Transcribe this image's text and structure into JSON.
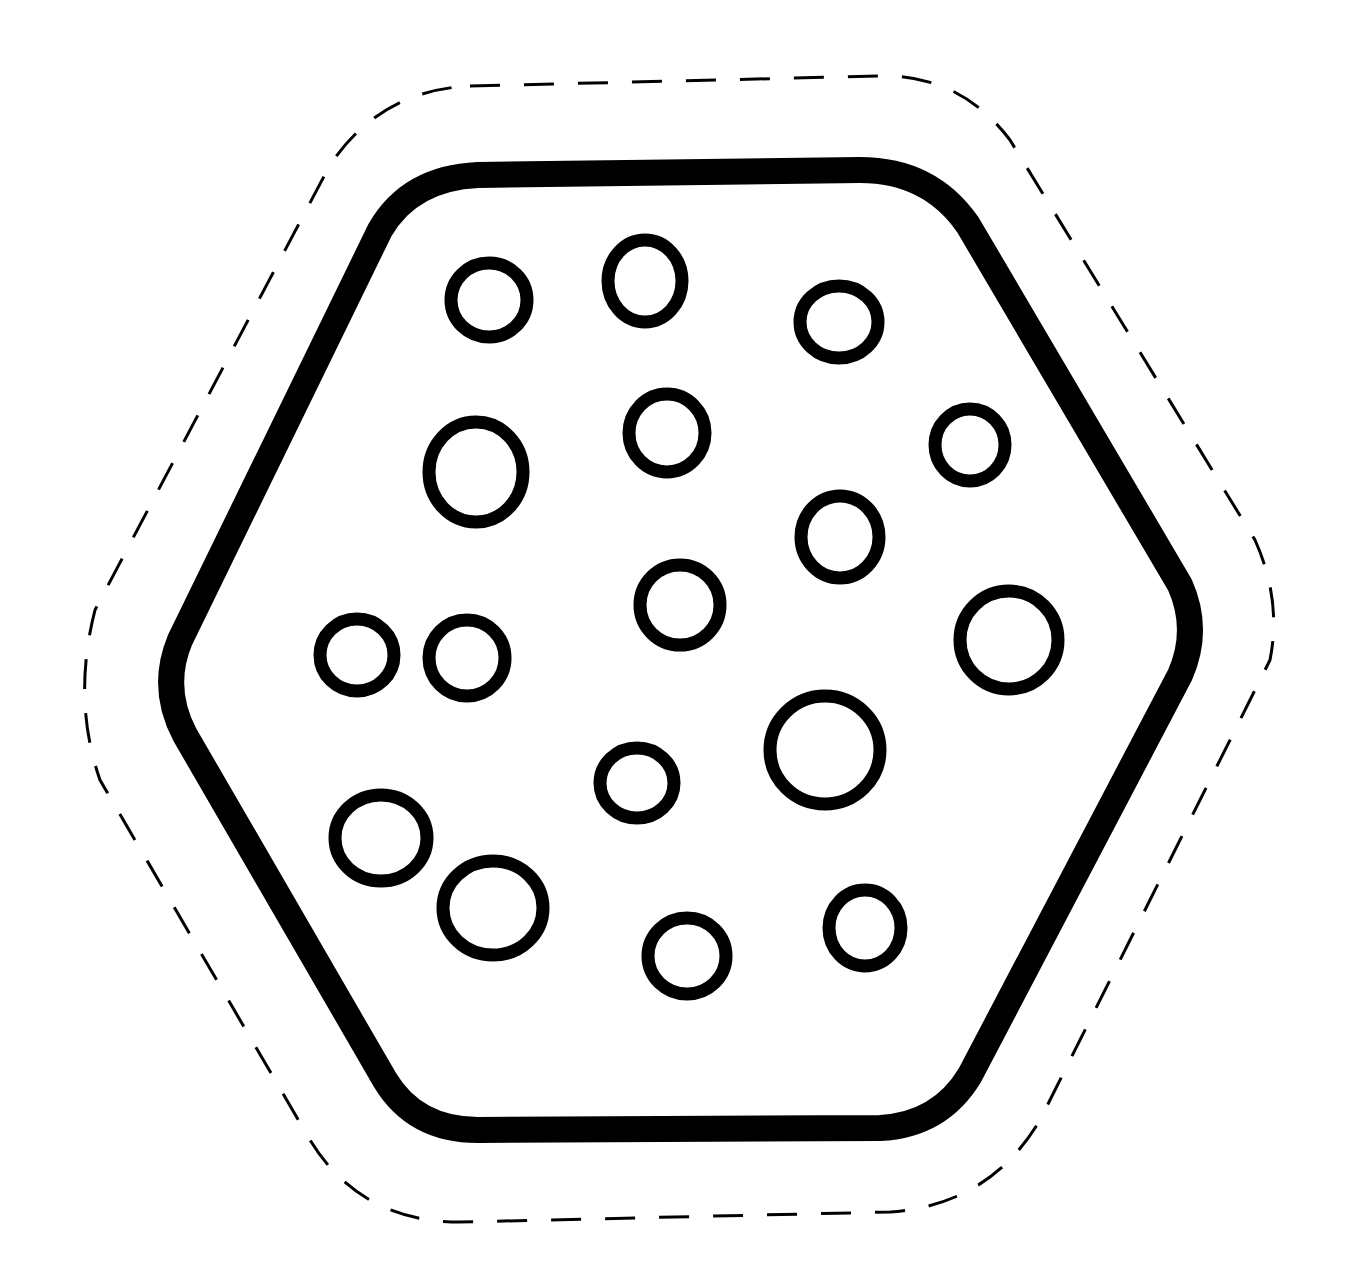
{
  "image": {
    "width": 1357,
    "height": 1283,
    "background": "#ffffff",
    "stroke_color": "#000000"
  },
  "cut_line": {
    "label": "dashed-cut-outline",
    "stroke_width": 3,
    "dash": "30 24",
    "path": "M 470 86 L 880 76 Q 960 74 1010 140 L 1255 540 Q 1282 600 1270 660 L 1040 1120 Q 990 1205 890 1212 L 460 1222 Q 360 1222 310 1140 L 100 780 Q 72 700 95 610 L 330 165 Q 380 90 470 86 Z"
  },
  "hexagon": {
    "label": "hexagon-cracker-outline",
    "stroke_width": 26,
    "path": "M 478 175 L 860 170 Q 930 170 968 225 L 1180 585 Q 1200 630 1180 675 L 970 1075 Q 940 1125 880 1128 L 478 1130 Q 415 1130 385 1080 L 185 735 Q 160 688 180 640 L 380 230 Q 410 178 478 175 Z"
  },
  "holes": [
    {
      "cx": 489,
      "cy": 300,
      "rx": 38,
      "ry": 37
    },
    {
      "cx": 645,
      "cy": 281,
      "rx": 37,
      "ry": 41
    },
    {
      "cx": 839,
      "cy": 322,
      "rx": 39,
      "ry": 36
    },
    {
      "cx": 476,
      "cy": 472,
      "rx": 47,
      "ry": 50
    },
    {
      "cx": 667,
      "cy": 433,
      "rx": 38,
      "ry": 39
    },
    {
      "cx": 970,
      "cy": 445,
      "rx": 35,
      "ry": 36
    },
    {
      "cx": 840,
      "cy": 537,
      "rx": 39,
      "ry": 41
    },
    {
      "cx": 680,
      "cy": 605,
      "rx": 40,
      "ry": 40
    },
    {
      "cx": 357,
      "cy": 655,
      "rx": 37,
      "ry": 36
    },
    {
      "cx": 467,
      "cy": 658,
      "rx": 38,
      "ry": 38
    },
    {
      "cx": 1009,
      "cy": 640,
      "rx": 49,
      "ry": 49
    },
    {
      "cx": 825,
      "cy": 750,
      "rx": 55,
      "ry": 54
    },
    {
      "cx": 637,
      "cy": 783,
      "rx": 37,
      "ry": 35
    },
    {
      "cx": 381,
      "cy": 838,
      "rx": 46,
      "ry": 43
    },
    {
      "cx": 493,
      "cy": 908,
      "rx": 50,
      "ry": 47
    },
    {
      "cx": 687,
      "cy": 956,
      "rx": 39,
      "ry": 38
    },
    {
      "cx": 865,
      "cy": 928,
      "rx": 36,
      "ry": 38
    }
  ],
  "hole_stroke_width": 13
}
